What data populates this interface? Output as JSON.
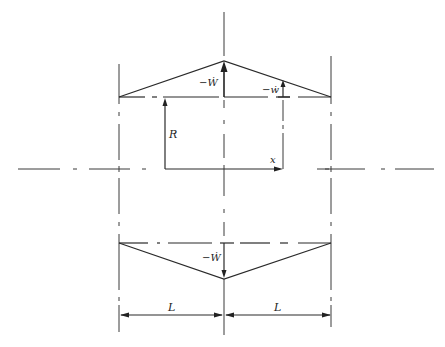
{
  "diagram": {
    "type": "engineering-schematic",
    "colors": {
      "line": "#2a2a2a",
      "background": "#ffffff"
    },
    "upper_profile": {
      "shape": "triangle-pointing-up",
      "labels": {
        "peak_velocity": "−Ẇ",
        "local_velocity": "−ẇ"
      }
    },
    "radius": {
      "label": "R"
    },
    "axis": {
      "label": "x"
    },
    "lower_profile": {
      "shape": "triangle-pointing-down",
      "labels": {
        "peak_velocity": "−Ẇ"
      }
    },
    "dimensions": [
      {
        "label": "L"
      },
      {
        "label": "L"
      }
    ]
  }
}
